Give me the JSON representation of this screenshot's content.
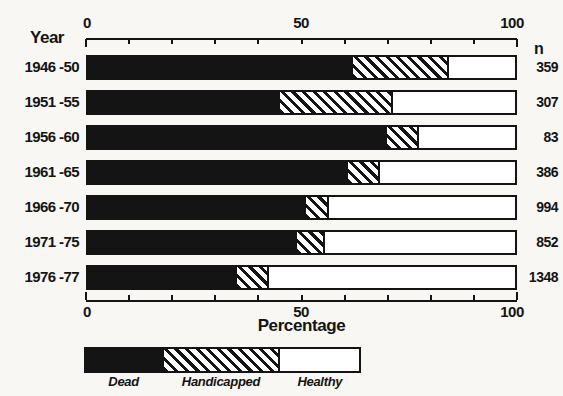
{
  "colors": {
    "ink": "#141414",
    "paper": "#f8f7f4",
    "hatch_bg": "#ffffff"
  },
  "chart_data": {
    "type": "bar",
    "orientation": "horizontal",
    "stacked": true,
    "xlabel": "Percentage",
    "ylabel_header": "Year",
    "n_header": "n",
    "xlim": [
      0,
      100
    ],
    "x_major_ticks": [
      0,
      50,
      100
    ],
    "x_minor_tick_step": 10,
    "grid": false,
    "legend_position": "bottom",
    "categories": [
      "1946 -50",
      "1951 -55",
      "1956 -60",
      "1961 -65",
      "1966 -70",
      "1971 -75",
      "1976 -77"
    ],
    "series": [
      {
        "name": "Dead",
        "style": "solid-black",
        "values": [
          62,
          45,
          70,
          61,
          51,
          49,
          35
        ]
      },
      {
        "name": "Handicapped",
        "style": "diagonal-hatch",
        "values": [
          22,
          26,
          7,
          7,
          5,
          6,
          7
        ]
      },
      {
        "name": "Healthy",
        "style": "white",
        "values": [
          16,
          29,
          23,
          32,
          44,
          45,
          58
        ]
      }
    ],
    "n_values": [
      359,
      307,
      83,
      386,
      994,
      852,
      1348
    ],
    "legend": [
      "Dead",
      "Handicapped",
      "Healthy"
    ],
    "legend_swatch_percents": [
      28.6,
      41.7,
      29.7
    ]
  }
}
